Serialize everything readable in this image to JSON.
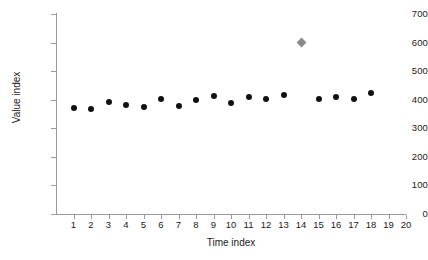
{
  "chart_data": {
    "type": "scatter",
    "title": "",
    "xlabel": "Time index",
    "ylabel": "Value index",
    "xlim": [
      0,
      20
    ],
    "ylim": [
      0,
      700
    ],
    "grid": false,
    "legend": false,
    "y_ticks": [
      0,
      100,
      200,
      300,
      400,
      500,
      600,
      700
    ],
    "y_tick_labels": [
      "0",
      "100",
      "200",
      "300",
      "400",
      "500",
      "600",
      "700"
    ],
    "x_ticks": [
      1,
      2,
      3,
      4,
      5,
      6,
      7,
      8,
      9,
      10,
      11,
      12,
      13,
      14,
      15,
      16,
      17,
      18,
      19,
      20
    ],
    "x_tick_labels": [
      "1",
      "2",
      "3",
      "4",
      "5",
      "6",
      "7",
      "8",
      "9",
      "10",
      "11",
      "12",
      "13",
      "14",
      "15",
      "16",
      "17",
      "18",
      "19",
      "20"
    ],
    "series": [
      {
        "name": "in-control values",
        "marker": "circle",
        "color": "#111111",
        "x": [
          1,
          2,
          3,
          4,
          5,
          6,
          7,
          8,
          9,
          10,
          11,
          12,
          13,
          15,
          16,
          17,
          18
        ],
        "values": [
          372,
          368,
          393,
          383,
          376,
          403,
          378,
          400,
          413,
          390,
          411,
          401,
          418,
          403,
          410,
          403,
          422
        ]
      },
      {
        "name": "outlier",
        "marker": "diamond",
        "color": "#8a8a8a",
        "x": [
          14
        ],
        "values": [
          601
        ]
      }
    ]
  },
  "axes": {
    "x_title": "Time index",
    "y_title": "Value index"
  }
}
